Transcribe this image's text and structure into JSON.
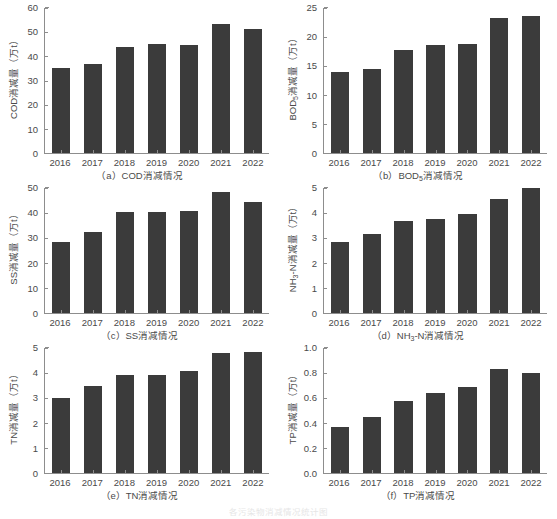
{
  "figure": {
    "caption": "各污染物消减情况统计图",
    "bar_color": "#3b3b3b",
    "axis_color": "#8d8d8d",
    "text_color": "#4a4a4a",
    "background": "#ffffff"
  },
  "chart_data": [
    {
      "type": "bar",
      "panel": "a",
      "title": "（a）COD消减情况",
      "ylabel": "COD消减量（万t）",
      "xlabel": "",
      "categories": [
        "2016",
        "2017",
        "2018",
        "2019",
        "2020",
        "2021",
        "2022"
      ],
      "values": [
        35.0,
        37.0,
        44.0,
        45.1,
        44.6,
        53.2,
        51.4
      ],
      "ylim": [
        0,
        60
      ],
      "yticks": [
        0,
        10,
        20,
        30,
        40,
        50,
        60
      ],
      "ytick_labels": [
        "0",
        "10",
        "20",
        "30",
        "40",
        "50",
        "60"
      ],
      "grid": false,
      "legend": "none"
    },
    {
      "type": "bar",
      "panel": "b",
      "title": "（b）BOD₅消减情况",
      "title_main": "（b）BOD",
      "title_sub": "5",
      "title_tail": "消减情况",
      "ylabel_main": "BOD",
      "ylabel_sub": "5",
      "ylabel_tail": "消减量（万t）",
      "ylabel": "BOD₅消减量（万t）",
      "xlabel": "",
      "categories": [
        "2016",
        "2017",
        "2018",
        "2019",
        "2020",
        "2021",
        "2022"
      ],
      "values": [
        14.0,
        14.5,
        17.8,
        18.7,
        18.8,
        23.2,
        23.7
      ],
      "ylim": [
        0,
        25
      ],
      "yticks": [
        0,
        5,
        10,
        15,
        20,
        25
      ],
      "ytick_labels": [
        "0",
        "5",
        "10",
        "15",
        "20",
        "25"
      ],
      "grid": false,
      "legend": "none"
    },
    {
      "type": "bar",
      "panel": "c",
      "title": "（c）SS消减情况",
      "ylabel": "SS消减量（万t）",
      "xlabel": "",
      "categories": [
        "2016",
        "2017",
        "2018",
        "2019",
        "2020",
        "2021",
        "2022"
      ],
      "values": [
        28.6,
        32.3,
        40.3,
        40.5,
        40.7,
        48.3,
        44.5
      ],
      "ylim": [
        0,
        50
      ],
      "yticks": [
        0,
        10,
        20,
        30,
        40,
        50
      ],
      "ytick_labels": [
        "0",
        "10",
        "20",
        "30",
        "40",
        "50"
      ],
      "grid": false,
      "legend": "none"
    },
    {
      "type": "bar",
      "panel": "d",
      "title": "（d）NH₃-N消减情况",
      "title_main": "（d）NH",
      "title_sub": "3",
      "title_tail": "-N消减情况",
      "ylabel_main": "NH",
      "ylabel_sub": "3",
      "ylabel_tail": "-N消减量（万t）",
      "ylabel": "NH₃-N消减量（万t）",
      "xlabel": "",
      "categories": [
        "2016",
        "2017",
        "2018",
        "2019",
        "2020",
        "2021",
        "2022"
      ],
      "values": [
        2.83,
        3.15,
        3.67,
        3.75,
        3.95,
        4.55,
        5.0
      ],
      "ylim": [
        0,
        5
      ],
      "yticks": [
        0,
        1,
        2,
        3,
        4,
        5
      ],
      "ytick_labels": [
        "0",
        "1",
        "2",
        "3",
        "4",
        "5"
      ],
      "grid": false,
      "legend": "none"
    },
    {
      "type": "bar",
      "panel": "e",
      "title": "（e）TN消减情况",
      "ylabel": "TN消减量（万t）",
      "xlabel": "",
      "categories": [
        "2016",
        "2017",
        "2018",
        "2019",
        "2020",
        "2021",
        "2022"
      ],
      "values": [
        3.0,
        3.47,
        3.92,
        3.93,
        4.08,
        4.8,
        4.85
      ],
      "ylim": [
        0,
        5
      ],
      "yticks": [
        0,
        1,
        2,
        3,
        4,
        5
      ],
      "ytick_labels": [
        "0",
        "1",
        "2",
        "3",
        "4",
        "5"
      ],
      "grid": false,
      "legend": "none"
    },
    {
      "type": "bar",
      "panel": "f",
      "title": "（f）TP消减情况",
      "ylabel": "TP消减量（万t）",
      "xlabel": "",
      "categories": [
        "2016",
        "2017",
        "2018",
        "2019",
        "2020",
        "2021",
        "2022"
      ],
      "values": [
        0.37,
        0.45,
        0.58,
        0.64,
        0.69,
        0.83,
        0.8
      ],
      "ylim": [
        0,
        1.0
      ],
      "yticks": [
        0,
        0.2,
        0.4,
        0.6,
        0.8,
        1.0
      ],
      "ytick_labels": [
        "0.0",
        "0.2",
        "0.4",
        "0.6",
        "0.8",
        "1.0"
      ],
      "grid": false,
      "legend": "none"
    }
  ]
}
